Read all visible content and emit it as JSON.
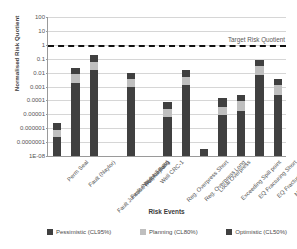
{
  "chart_data": {
    "type": "bar",
    "title": "",
    "xlabel": "Risk Events",
    "ylabel": "Normalised Risk Quotient",
    "yscale": "log",
    "ylim": [
      1e-08,
      100
    ],
    "grid": true,
    "stacked": true,
    "legend_position": "bottom",
    "ytick_labels": [
      "100",
      "10",
      "1",
      "0.1",
      "0.01",
      "0.001",
      "0.0001",
      "0.00001",
      "0.000001",
      "0.0000001",
      "1E-08"
    ],
    "ytick_values": [
      100,
      10,
      1,
      0.1,
      0.01,
      0.001,
      0.0001,
      1e-05,
      1e-06,
      1e-07,
      1e-08
    ],
    "categories": [
      "Perm Seal",
      "Fault (Naylor)",
      "Fault Junction (Naylor East)",
      "Fault (Naylor South)",
      "Well Naylor-1",
      "Well CRC-1",
      "Reg. Overpress Short",
      "Reg. Overpress Long",
      "Local Overpress",
      "Exceeding Spill point",
      "EQ Fracturing Short",
      "EQ Fracturing Long",
      "Migration Direction"
    ],
    "series": [
      {
        "name": "Optimistic (CL50%)",
        "color": "#404040",
        "values": [
          2.2e-07,
          0.0019,
          0.016,
          null,
          0.0009,
          null,
          6e-06,
          0.0013,
          3.2e-08,
          8.5e-06,
          1.8e-05,
          0.0065,
          0.00025
        ]
      },
      {
        "name": "Planning (CL80%)",
        "color": "#bfbfbf",
        "values": [
          7e-07,
          0.0085,
          0.055,
          null,
          0.0032,
          null,
          2.5e-05,
          0.0052,
          null,
          3.5e-05,
          9e-05,
          0.032,
          0.0013
        ]
      },
      {
        "name": "Pessimistic (CL95%)",
        "color": "#404040",
        "values": [
          2.5e-06,
          0.021,
          0.18,
          null,
          0.0092,
          null,
          8e-05,
          0.016,
          null,
          0.00014,
          0.00026,
          0.075,
          0.0037
        ]
      }
    ],
    "annotations": [
      {
        "name": "target-risk-quotient",
        "label": "Target Risk Quotient",
        "value": 1,
        "style": "dashed"
      }
    ]
  },
  "legend": {
    "items": [
      {
        "label": "Pessimistic (CL95%)",
        "color": "#404040"
      },
      {
        "label": "Planning (CL80%)",
        "color": "#bfbfbf"
      },
      {
        "label": "Optimistic (CL50%)",
        "color": "#404040"
      }
    ]
  }
}
